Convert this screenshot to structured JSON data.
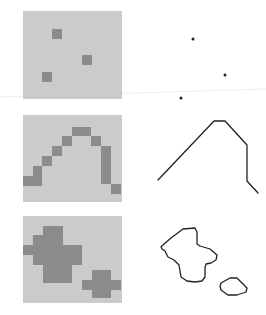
{
  "colors": {
    "background": "#ffffff",
    "grid_background": "#cbcbcb",
    "grid_cell_fill": "#8b8b8b",
    "vector_stroke": "#222222",
    "artifact_line": "#ececec"
  },
  "rows": [
    {
      "id": "points",
      "label": "Raster points to vector points",
      "grid": {
        "x": 23,
        "y": 11,
        "width": 99,
        "height": 88,
        "cells": [
          {
            "x": 52,
            "y": 29,
            "w": 10,
            "h": 10
          },
          {
            "x": 82,
            "y": 55,
            "w": 10,
            "h": 10
          },
          {
            "x": 42,
            "y": 72,
            "w": 10,
            "h": 10
          }
        ]
      },
      "vector": {
        "type": "points",
        "points": [
          [
            193,
            39
          ],
          [
            225,
            75
          ],
          [
            181,
            98
          ]
        ]
      }
    },
    {
      "id": "lines",
      "label": "Raster line to vector polyline",
      "grid": {
        "x": 23,
        "y": 115,
        "width": 99,
        "height": 87,
        "cells": [
          {
            "x": 23,
            "y": 176,
            "w": 19,
            "h": 10
          },
          {
            "x": 33,
            "y": 166,
            "w": 9,
            "h": 10
          },
          {
            "x": 42,
            "y": 156,
            "w": 10,
            "h": 10
          },
          {
            "x": 52,
            "y": 146,
            "w": 10,
            "h": 10
          },
          {
            "x": 62,
            "y": 136,
            "w": 10,
            "h": 10
          },
          {
            "x": 72,
            "y": 127,
            "w": 19,
            "h": 9
          },
          {
            "x": 91,
            "y": 136,
            "w": 10,
            "h": 10
          },
          {
            "x": 101,
            "y": 146,
            "w": 10,
            "h": 38
          },
          {
            "x": 111,
            "y": 184,
            "w": 10,
            "h": 10
          }
        ]
      },
      "vector": {
        "type": "polyline",
        "points": [
          [
            158,
            180
          ],
          [
            214,
            121
          ],
          [
            225,
            121
          ],
          [
            247,
            145
          ],
          [
            247,
            181
          ],
          [
            258,
            193
          ]
        ]
      }
    },
    {
      "id": "polygons",
      "label": "Raster regions to vector polygons",
      "grid": {
        "x": 23,
        "y": 216,
        "width": 99,
        "height": 87,
        "cells": [
          {
            "x": 43,
            "y": 226,
            "w": 20,
            "h": 9
          },
          {
            "x": 33,
            "y": 235,
            "w": 30,
            "h": 10
          },
          {
            "x": 23,
            "y": 245,
            "w": 59,
            "h": 10
          },
          {
            "x": 33,
            "y": 255,
            "w": 49,
            "h": 10
          },
          {
            "x": 43,
            "y": 265,
            "w": 29,
            "h": 18
          },
          {
            "x": 92,
            "y": 270,
            "w": 19,
            "h": 10
          },
          {
            "x": 82,
            "y": 280,
            "w": 39,
            "h": 10
          },
          {
            "x": 92,
            "y": 290,
            "w": 19,
            "h": 8
          }
        ]
      },
      "vector": {
        "type": "polygons",
        "polygons": [
          [
            [
              183,
              229
            ],
            [
              195,
              228
            ],
            [
              197,
              232
            ],
            [
              197,
              244
            ],
            [
              200,
              246
            ],
            [
              210,
              249
            ],
            [
              217,
              255
            ],
            [
              216,
              260
            ],
            [
              211,
              263
            ],
            [
              206,
              264
            ],
            [
              205,
              268
            ],
            [
              205,
              277
            ],
            [
              202,
              281
            ],
            [
              195,
              282
            ],
            [
              187,
              281
            ],
            [
              181,
              277
            ],
            [
              180,
              271
            ],
            [
              179,
              265
            ],
            [
              174,
              260
            ],
            [
              168,
              257
            ],
            [
              165,
              251
            ],
            [
              162,
              249
            ],
            [
              161,
              247
            ],
            [
              163,
              245
            ],
            [
              171,
              238
            ]
          ],
          [
            [
              221,
              283
            ],
            [
              230,
              278
            ],
            [
              237,
              278
            ],
            [
              241,
              282
            ],
            [
              247,
              288
            ],
            [
              246,
              292
            ],
            [
              237,
              295
            ],
            [
              228,
              295
            ],
            [
              221,
              290
            ],
            [
              220,
              286
            ]
          ]
        ]
      }
    }
  ],
  "artifact_line": {
    "x1": 0,
    "y1": 97,
    "x2": 266,
    "y2": 89
  }
}
